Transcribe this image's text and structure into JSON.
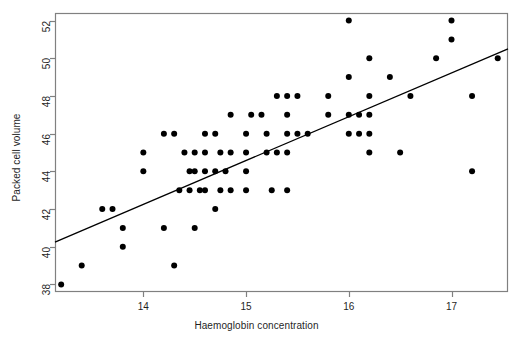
{
  "chart_data": {
    "type": "scatter",
    "title": "",
    "xlabel": "Haemoglobin concentration",
    "ylabel": "Packed cell volume",
    "xlim": [
      13.14,
      17.55
    ],
    "ylim": [
      37.6,
      52.4
    ],
    "xticks": [
      14,
      15,
      16,
      17
    ],
    "xtick_labels": [
      "14",
      "15",
      "16",
      "17"
    ],
    "yticks": [
      38,
      40,
      42,
      44,
      46,
      48,
      50,
      52
    ],
    "ytick_labels": [
      "38",
      "40",
      "42",
      "44",
      "46",
      "48",
      "50",
      "52"
    ],
    "grid": false,
    "legend": null,
    "point_color": "#000000",
    "point_shape": "filled-circle",
    "point_radius_px": 3.0,
    "line_color": "#000000",
    "frame_color": "#808080",
    "background": "#ffffff",
    "regression_line": {
      "label": "fitted least-squares line",
      "x_start": 13.14,
      "y_start": 40.25,
      "x_end": 17.55,
      "y_end": 50.5,
      "slope": 2.32,
      "intercept": 9.75
    },
    "points": [
      {
        "x": 13.2,
        "y": 38
      },
      {
        "x": 13.4,
        "y": 39
      },
      {
        "x": 13.6,
        "y": 42
      },
      {
        "x": 13.7,
        "y": 42
      },
      {
        "x": 13.8,
        "y": 41
      },
      {
        "x": 13.8,
        "y": 40
      },
      {
        "x": 14.0,
        "y": 45
      },
      {
        "x": 14.0,
        "y": 44
      },
      {
        "x": 14.2,
        "y": 46
      },
      {
        "x": 14.3,
        "y": 46
      },
      {
        "x": 14.2,
        "y": 41
      },
      {
        "x": 14.3,
        "y": 39
      },
      {
        "x": 14.35,
        "y": 43
      },
      {
        "x": 14.4,
        "y": 45
      },
      {
        "x": 14.45,
        "y": 44
      },
      {
        "x": 14.45,
        "y": 43
      },
      {
        "x": 14.5,
        "y": 45
      },
      {
        "x": 14.5,
        "y": 44
      },
      {
        "x": 14.5,
        "y": 41
      },
      {
        "x": 14.55,
        "y": 43
      },
      {
        "x": 14.6,
        "y": 46
      },
      {
        "x": 14.6,
        "y": 45
      },
      {
        "x": 14.6,
        "y": 44
      },
      {
        "x": 14.6,
        "y": 43
      },
      {
        "x": 14.7,
        "y": 46
      },
      {
        "x": 14.7,
        "y": 44
      },
      {
        "x": 14.7,
        "y": 42
      },
      {
        "x": 14.75,
        "y": 45
      },
      {
        "x": 14.75,
        "y": 43
      },
      {
        "x": 14.8,
        "y": 44
      },
      {
        "x": 14.85,
        "y": 47
      },
      {
        "x": 14.85,
        "y": 45
      },
      {
        "x": 14.85,
        "y": 43
      },
      {
        "x": 15.0,
        "y": 46
      },
      {
        "x": 15.0,
        "y": 45
      },
      {
        "x": 15.0,
        "y": 44
      },
      {
        "x": 15.0,
        "y": 43
      },
      {
        "x": 15.05,
        "y": 47
      },
      {
        "x": 15.15,
        "y": 47
      },
      {
        "x": 15.2,
        "y": 46
      },
      {
        "x": 15.2,
        "y": 45
      },
      {
        "x": 15.25,
        "y": 43
      },
      {
        "x": 15.3,
        "y": 48
      },
      {
        "x": 15.3,
        "y": 45
      },
      {
        "x": 15.4,
        "y": 48
      },
      {
        "x": 15.4,
        "y": 47
      },
      {
        "x": 15.4,
        "y": 46
      },
      {
        "x": 15.4,
        "y": 45
      },
      {
        "x": 15.4,
        "y": 43
      },
      {
        "x": 15.5,
        "y": 48
      },
      {
        "x": 15.5,
        "y": 46
      },
      {
        "x": 15.6,
        "y": 46
      },
      {
        "x": 15.8,
        "y": 48
      },
      {
        "x": 15.8,
        "y": 47
      },
      {
        "x": 16.0,
        "y": 52
      },
      {
        "x": 16.0,
        "y": 49
      },
      {
        "x": 16.0,
        "y": 47
      },
      {
        "x": 16.0,
        "y": 46
      },
      {
        "x": 16.1,
        "y": 47
      },
      {
        "x": 16.1,
        "y": 46
      },
      {
        "x": 16.2,
        "y": 50
      },
      {
        "x": 16.2,
        "y": 48
      },
      {
        "x": 16.2,
        "y": 47
      },
      {
        "x": 16.2,
        "y": 46
      },
      {
        "x": 16.2,
        "y": 45
      },
      {
        "x": 16.4,
        "y": 49
      },
      {
        "x": 16.5,
        "y": 45
      },
      {
        "x": 16.6,
        "y": 48
      },
      {
        "x": 16.85,
        "y": 50
      },
      {
        "x": 17.0,
        "y": 52
      },
      {
        "x": 17.0,
        "y": 51
      },
      {
        "x": 17.2,
        "y": 48
      },
      {
        "x": 17.2,
        "y": 44
      },
      {
        "x": 17.45,
        "y": 50
      }
    ]
  }
}
